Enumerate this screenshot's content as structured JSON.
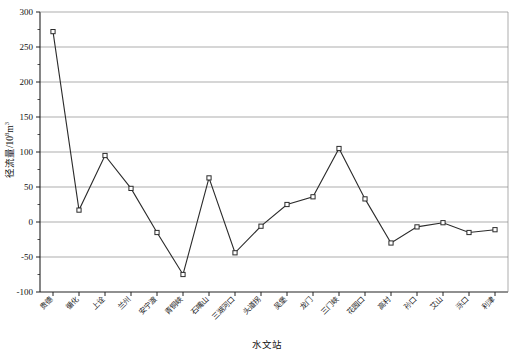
{
  "chart_data": {
    "type": "line",
    "title": "",
    "xlabel": "水文站",
    "ylabel": "径流量/10",
    "ylabel_exponent": "8",
    "ylabel_unit": "m",
    "ylabel_unit_exponent": "3",
    "ylabel_full": "径流量/10⁸m³",
    "ylim": [
      -100,
      300
    ],
    "yticks": [
      -100,
      -50,
      0,
      50,
      100,
      150,
      200,
      250,
      300
    ],
    "ytick_labels": [
      "-100",
      "-50",
      "0",
      "50",
      "100",
      "150",
      "200",
      "250",
      "300"
    ],
    "grid": true,
    "grid_axis": "y",
    "legend": "none",
    "marker": "square-open",
    "line_color": "#2b2b2b",
    "marker_color": "#2b2b2b",
    "grid_color": "#8a8a8a",
    "categories": [
      "贵德",
      "循化",
      "上诠",
      "兰州",
      "安宁渡",
      "青铜峡",
      "石嘴山",
      "三湖河口",
      "头道拐",
      "吴堡",
      "龙门",
      "三门峡",
      "花园口",
      "高村",
      "孙口",
      "艾山",
      "泺口",
      "利津"
    ],
    "values": [
      272,
      17,
      95,
      48,
      -15,
      -75,
      63,
      -44,
      -6,
      25,
      36,
      105,
      33,
      -30,
      -7,
      -1,
      -15,
      -11
    ],
    "series": [
      {
        "name": "径流量",
        "values": [
          272,
          17,
          95,
          48,
          -15,
          -75,
          63,
          -44,
          -6,
          25,
          36,
          105,
          33,
          -30,
          -7,
          -1,
          -15,
          -11
        ]
      }
    ]
  },
  "axis": {
    "x_title": "水文站",
    "y_title_main": "径流量/10",
    "y_title_sup": "8",
    "y_title_tail": "m",
    "y_title_sup2": "3"
  }
}
